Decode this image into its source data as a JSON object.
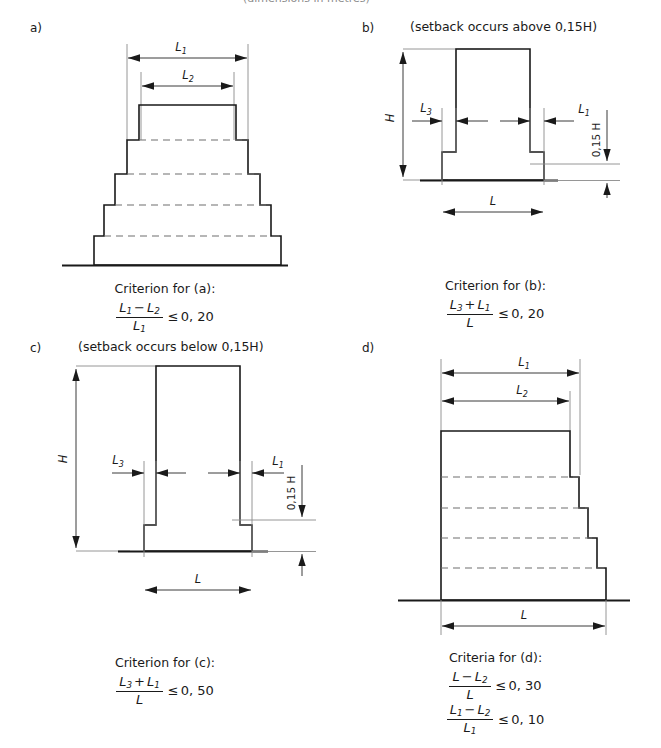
{
  "figure": {
    "top_clipped_text": "(dimensions in metres)",
    "panels": [
      {
        "id": "a",
        "letter": "a)",
        "note": "",
        "dim_labels": {
          "top1": "L",
          "top1_sub": "1",
          "top2": "L",
          "top2_sub": "2"
        },
        "criterion_title": "Criterion for (a):",
        "formulas": [
          {
            "num_a": "L",
            "num_a_sub": "1",
            "op": "−",
            "num_b": "L",
            "num_b_sub": "2",
            "den": "L",
            "den_sub": "1",
            "rel": "≤",
            "rhs": "0, 20"
          }
        ]
      },
      {
        "id": "b",
        "letter": "b)",
        "note": "(setback occurs above 0,15H)",
        "dim_labels": {
          "height": "H",
          "left_setback": "L",
          "left_setback_sub": "3",
          "right_setback": "L",
          "right_setback_sub": "1",
          "base_width": "L",
          "vertical_fraction": "0,15 H"
        },
        "criterion_title": "Criterion for (b):",
        "formulas": [
          {
            "num_a": "L",
            "num_a_sub": "3",
            "op": "+",
            "num_b": "L",
            "num_b_sub": "1",
            "den": "L",
            "den_sub": "",
            "rel": "≤",
            "rhs": "0, 20"
          }
        ]
      },
      {
        "id": "c",
        "letter": "c)",
        "note": "(setback occurs below 0,15H)",
        "dim_labels": {
          "height": "H",
          "left_setback": "L",
          "left_setback_sub": "3",
          "right_setback": "L",
          "right_setback_sub": "1",
          "base_width": "L",
          "vertical_fraction": "0,15 H"
        },
        "criterion_title": "Criterion for (c):",
        "formulas": [
          {
            "num_a": "L",
            "num_a_sub": "3",
            "op": "+",
            "num_b": "L",
            "num_b_sub": "1",
            "den": "L",
            "den_sub": "",
            "rel": "≤",
            "rhs": "0, 50"
          }
        ]
      },
      {
        "id": "d",
        "letter": "d)",
        "note": "",
        "dim_labels": {
          "top1": "L",
          "top1_sub": "1",
          "top2": "L",
          "top2_sub": "2",
          "base_width": "L"
        },
        "criterion_title": "Criteria for (d):",
        "formulas": [
          {
            "num_a": "L",
            "num_a_sub": "",
            "op": "−",
            "num_b": "L",
            "num_b_sub": "2",
            "den": "L",
            "den_sub": "",
            "rel": "≤",
            "rhs": "0, 30"
          },
          {
            "num_a": "L",
            "num_a_sub": "1",
            "op": "−",
            "num_b": "L",
            "num_b_sub": "2",
            "den": "L",
            "den_sub": "1",
            "rel": "≤",
            "rhs": "0, 10"
          }
        ]
      }
    ]
  },
  "colors": {
    "ink": "#1a1a1a",
    "dashed": "#6e6e6e",
    "extension": "#8a8a8a",
    "background": "#ffffff"
  }
}
